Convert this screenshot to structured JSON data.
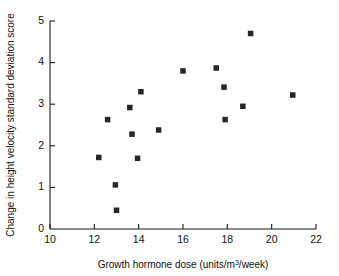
{
  "chart_data": {
    "type": "scatter",
    "title": "",
    "xlabel": "Growth hormone dose  (units/m³/week)",
    "xlabel_prefix": "Growth hormone dose  (units/m",
    "xlabel_superscript": "3",
    "xlabel_suffix": "/week)",
    "ylabel": "Change in height velocity standard deviation score",
    "xlim": [
      10,
      22
    ],
    "ylim": [
      0,
      5
    ],
    "xticks": [
      10,
      12,
      14,
      16,
      18,
      20,
      22
    ],
    "xtick_labels": [
      "10",
      "12",
      "14",
      "16",
      "18",
      "20",
      "22"
    ],
    "yticks": [
      0,
      1,
      2,
      3,
      4,
      5
    ],
    "ytick_labels": [
      "0",
      "1",
      "2",
      "3",
      "4",
      "5"
    ],
    "grid": false,
    "legend": null,
    "marker": "square",
    "marker_color": "#262626",
    "marker_size": 5.5,
    "n_points": 17,
    "points": [
      {
        "x": 12.2,
        "y": 1.72
      },
      {
        "x": 12.6,
        "y": 2.63
      },
      {
        "x": 12.95,
        "y": 1.06
      },
      {
        "x": 13.0,
        "y": 0.45
      },
      {
        "x": 13.6,
        "y": 2.92
      },
      {
        "x": 13.7,
        "y": 2.28
      },
      {
        "x": 13.95,
        "y": 1.7
      },
      {
        "x": 14.1,
        "y": 3.3
      },
      {
        "x": 14.9,
        "y": 2.38
      },
      {
        "x": 16.0,
        "y": 3.8
      },
      {
        "x": 17.5,
        "y": 3.87
      },
      {
        "x": 17.85,
        "y": 3.41
      },
      {
        "x": 17.9,
        "y": 2.63
      },
      {
        "x": 18.7,
        "y": 2.95
      },
      {
        "x": 19.05,
        "y": 4.7
      },
      {
        "x": 20.95,
        "y": 3.22
      },
      {
        "x": 12.2,
        "y": 1.72
      }
    ],
    "x_values": [
      12.2,
      12.6,
      12.95,
      13.0,
      13.6,
      13.7,
      13.95,
      14.1,
      14.9,
      16.0,
      17.5,
      17.85,
      17.9,
      18.7,
      19.05,
      20.95
    ],
    "y_values": [
      1.72,
      2.63,
      1.06,
      0.45,
      2.92,
      2.28,
      1.7,
      3.3,
      2.38,
      3.8,
      3.87,
      3.41,
      2.63,
      2.95,
      4.7,
      3.22
    ]
  },
  "figure": {
    "background": "#ffffff",
    "axis_color": "#1a1a1a"
  }
}
